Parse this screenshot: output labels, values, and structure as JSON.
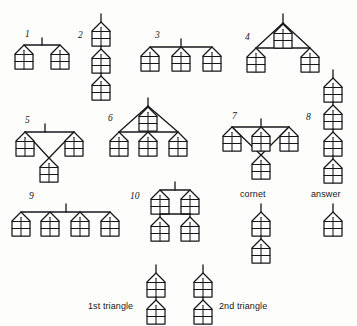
{
  "figure": {
    "title_fragment_cropped": "",
    "node_glyph": {
      "name": "house-node",
      "description": "pentagon house outline with 2x2 grid of cells"
    },
    "labels": {
      "item_1": "1",
      "item_2": "2",
      "item_3": "3",
      "item_4": "4",
      "item_5": "5",
      "item_6": "6",
      "item_7": "7",
      "item_8": "8",
      "item_9": "9",
      "item_10": "10",
      "cornet": "cornet",
      "answer": "answer",
      "first_triangle": "1st triangle",
      "second_triangle": "2nd triangle"
    },
    "colors": {
      "ink": "#17171a",
      "paper": "#fdfdfc"
    },
    "items": [
      {
        "id": "1",
        "node_count": 2,
        "shape": "horizontal-bar-2-nodes-with-stem"
      },
      {
        "id": "2",
        "node_count": 3,
        "shape": "vertical-chain-3-nodes-with-stem"
      },
      {
        "id": "3",
        "node_count": 3,
        "shape": "horizontal-bar-3-nodes-with-stem"
      },
      {
        "id": "4",
        "node_count": 3,
        "shape": "apex-triangle-2-base-nodes-1-hanging"
      },
      {
        "id": "5",
        "node_count": 3,
        "shape": "bar-2-nodes-diagonals-down-to-1-node"
      },
      {
        "id": "6",
        "node_count": 4,
        "shape": "apex-triangle-3-base-nodes-1-hanging"
      },
      {
        "id": "7",
        "node_count": 4,
        "shape": "bar-3-nodes-diagonals-down-to-1-node"
      },
      {
        "id": "8",
        "node_count": 4,
        "shape": "vertical-chain-4-nodes-with-stem"
      },
      {
        "id": "9",
        "node_count": 4,
        "shape": "horizontal-bar-4-nodes-with-stem"
      },
      {
        "id": "10",
        "node_count": 4,
        "shape": "two-bars-2x2-nodes-with-stem"
      },
      {
        "id": "cornet",
        "node_count": 2,
        "shape": "vertical-chain-2-nodes-with-stem"
      },
      {
        "id": "answer",
        "node_count": 1,
        "shape": "single-node-with-stem"
      },
      {
        "id": "1st triangle",
        "node_count": 2,
        "shape": "vertical-chain-2-nodes-with-stem"
      },
      {
        "id": "2nd triangle",
        "node_count": 2,
        "shape": "vertical-chain-2-nodes-with-stem"
      }
    ]
  }
}
